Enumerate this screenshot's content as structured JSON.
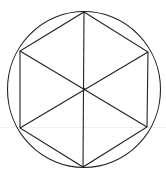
{
  "diagram": {
    "title": "",
    "shape": "regular hexagon inscribed in circle with three main diagonals",
    "stroke_color": "#222222",
    "background": "#ffffff",
    "circle": {
      "cx": 84,
      "cy": 89.5,
      "rx": 76.5,
      "ry": 78
    },
    "center": {
      "x": 84,
      "y": 89
    },
    "vertices": [
      {
        "x": 84,
        "y": 12
      },
      {
        "x": 148,
        "y": 52
      },
      {
        "x": 147,
        "y": 127
      },
      {
        "x": 83,
        "y": 167
      },
      {
        "x": 20,
        "y": 128
      },
      {
        "x": 20,
        "y": 51
      }
    ],
    "faint_guide_y": 127
  }
}
